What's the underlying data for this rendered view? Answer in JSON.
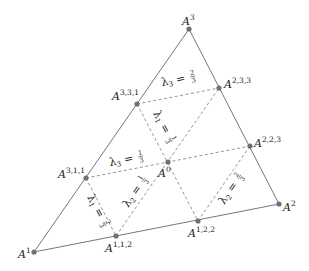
{
  "diagram": {
    "colors": {
      "edge": "#777777",
      "dashed": "#888888",
      "point": "#707070",
      "text": "#222222"
    },
    "vertices": [
      {
        "id": "A1",
        "base": "A",
        "sup": "1",
        "x": 34,
        "y": 252
      },
      {
        "id": "A2",
        "base": "A",
        "sup": "2",
        "x": 279,
        "y": 204
      },
      {
        "id": "A3",
        "base": "A",
        "sup": "3",
        "x": 189,
        "y": 29
      }
    ],
    "points": [
      {
        "id": "A331",
        "base": "A",
        "sup": "3,3,1",
        "x": 137,
        "y": 104
      },
      {
        "id": "A311",
        "base": "A",
        "sup": "3,1,1",
        "x": 86,
        "y": 178
      },
      {
        "id": "A233",
        "base": "A",
        "sup": "2,3,3",
        "x": 219,
        "y": 88
      },
      {
        "id": "A223",
        "base": "A",
        "sup": "2,2,3",
        "x": 250,
        "y": 146
      },
      {
        "id": "A122",
        "base": "A",
        "sup": "1,2,2",
        "x": 198,
        "y": 221
      },
      {
        "id": "A112",
        "base": "A",
        "sup": "1,1,2",
        "x": 116,
        "y": 236
      },
      {
        "id": "A0",
        "base": "A",
        "sup": "0",
        "x": 168,
        "y": 162
      }
    ],
    "level_lines": [
      {
        "label": "λ3 = 2/3",
        "lambda": "λ",
        "sub": "3",
        "num": "2",
        "den": "3"
      },
      {
        "label": "λ3 = 1/3",
        "lambda": "λ",
        "sub": "3",
        "num": "1",
        "den": "3"
      },
      {
        "label": "λ1 = 1/3",
        "lambda": "λ",
        "sub": "1",
        "num": "1",
        "den": "3"
      },
      {
        "label": "λ1 = 2/3",
        "lambda": "λ",
        "sub": "1",
        "num": "2",
        "den": "3"
      },
      {
        "label": "λ2 = 1/3",
        "lambda": "λ",
        "sub": "2",
        "num": "1",
        "den": "3"
      },
      {
        "label": "λ2 = 2/3",
        "lambda": "λ",
        "sub": "2",
        "num": "2",
        "den": "3"
      }
    ]
  }
}
